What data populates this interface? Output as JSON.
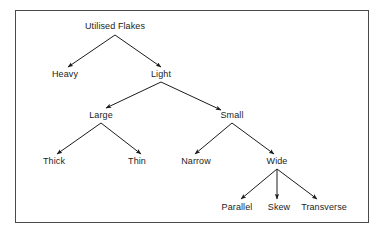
{
  "diagram": {
    "type": "hierarchy-tree",
    "orientation": "top-down",
    "frame": {
      "border_color": "#4a4a4a",
      "background_color": "#ffffff",
      "x": 15,
      "y": 10,
      "width": 354,
      "height": 213
    },
    "style": {
      "text_color": "#1c1c1c",
      "edge_color": "#1c1c1c",
      "arrowhead": "filled-triangle"
    },
    "levels": [
      {
        "index": 0,
        "labels": [
          "Utilised Flakes"
        ]
      },
      {
        "index": 1,
        "labels": [
          "Heavy",
          "Light"
        ]
      },
      {
        "index": 2,
        "labels": [
          "Large",
          "Small"
        ]
      },
      {
        "index": 3,
        "labels": [
          "Thick",
          "Thin",
          "Narrow",
          "Wide"
        ]
      },
      {
        "index": 4,
        "labels": [
          "Parallel",
          "Skew",
          "Transverse"
        ]
      }
    ],
    "nodes": [
      {
        "id": "utilised-flakes",
        "label": "Utilised Flakes",
        "x": 115,
        "y": 26,
        "level": 0
      },
      {
        "id": "heavy",
        "label": "Heavy",
        "x": 65,
        "y": 74,
        "level": 1
      },
      {
        "id": "light",
        "label": "Light",
        "x": 161,
        "y": 74,
        "level": 1
      },
      {
        "id": "large",
        "label": "Large",
        "x": 101,
        "y": 115,
        "level": 2
      },
      {
        "id": "small",
        "label": "Small",
        "x": 232,
        "y": 115,
        "level": 2
      },
      {
        "id": "thick",
        "label": "Thick",
        "x": 54,
        "y": 161,
        "level": 3
      },
      {
        "id": "thin",
        "label": "Thin",
        "x": 137,
        "y": 161,
        "level": 3
      },
      {
        "id": "narrow",
        "label": "Narrow",
        "x": 196,
        "y": 161,
        "level": 3
      },
      {
        "id": "wide",
        "label": "Wide",
        "x": 277,
        "y": 161,
        "level": 3
      },
      {
        "id": "parallel",
        "label": "Parallel",
        "x": 237,
        "y": 207,
        "level": 4
      },
      {
        "id": "skew",
        "label": "Skew",
        "x": 279,
        "y": 207,
        "level": 4
      },
      {
        "id": "transverse",
        "label": "Transverse",
        "x": 324,
        "y": 207,
        "level": 4
      }
    ],
    "edges": [
      {
        "from": "utilised-flakes",
        "to": "heavy"
      },
      {
        "from": "utilised-flakes",
        "to": "light"
      },
      {
        "from": "light",
        "to": "large"
      },
      {
        "from": "light",
        "to": "small"
      },
      {
        "from": "large",
        "to": "thick"
      },
      {
        "from": "large",
        "to": "thin"
      },
      {
        "from": "small",
        "to": "narrow"
      },
      {
        "from": "small",
        "to": "wide"
      },
      {
        "from": "wide",
        "to": "parallel"
      },
      {
        "from": "wide",
        "to": "skew"
      },
      {
        "from": "wide",
        "to": "transverse"
      }
    ]
  }
}
